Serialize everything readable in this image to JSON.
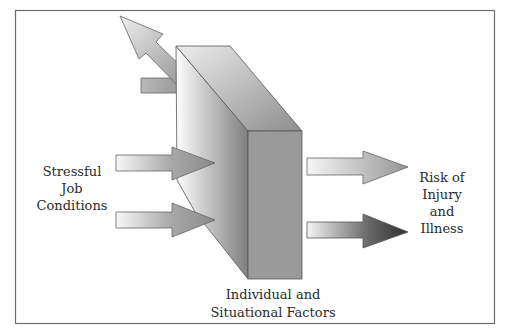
{
  "diagram": {
    "title": "",
    "input_label": {
      "lines": [
        "Stressful",
        "Job",
        "Conditions"
      ]
    },
    "moderator_label": {
      "lines": [
        "Individual and",
        "Situational Factors"
      ]
    },
    "outcome_label": {
      "lines": [
        "Risk of",
        "Injury",
        "and",
        "Illness"
      ]
    },
    "elements": [
      {
        "id": "input-arrow-1",
        "type": "arrow",
        "direction": "right",
        "into": "moderator-block"
      },
      {
        "id": "input-arrow-2",
        "type": "arrow",
        "direction": "right",
        "into": "moderator-block"
      },
      {
        "id": "deflected-arrow",
        "type": "arrow",
        "direction": "up-left",
        "from": "moderator-block"
      },
      {
        "id": "moderator-block",
        "type": "3d-block",
        "label": "Individual and Situational Factors"
      },
      {
        "id": "output-arrow-1",
        "type": "arrow",
        "direction": "right",
        "shade": "light"
      },
      {
        "id": "output-arrow-2",
        "type": "arrow",
        "direction": "right",
        "shade": "dark"
      }
    ],
    "colors": {
      "border": "#6e6e6e",
      "stroke": "#555555",
      "block_front": "#9a9a9a",
      "block_top_light": "#e4e4e4",
      "block_top_dark": "#8e8e8e",
      "arrow_light": "#f4f4f4",
      "arrow_mid": "#9c9c9c",
      "arrow_dark": "#3c3c3c"
    }
  }
}
